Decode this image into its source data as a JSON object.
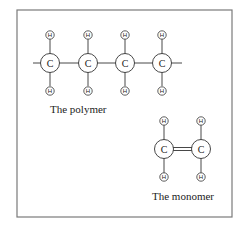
{
  "polymer": {
    "caption": "The polymer",
    "carbon_label": "C",
    "hydrogen_label": "H",
    "carbons": [
      {
        "x": 50,
        "y": 63
      },
      {
        "x": 88,
        "y": 63
      },
      {
        "x": 125,
        "y": 63
      },
      {
        "x": 162,
        "y": 63
      }
    ]
  },
  "monomer": {
    "caption": "The monomer",
    "carbon_label": "C",
    "hydrogen_label": "H",
    "bond": "double",
    "carbons": [
      {
        "x": 164,
        "y": 149
      },
      {
        "x": 201,
        "y": 149
      }
    ]
  },
  "colors": {
    "frame": "#7a7a7a",
    "ink": "#333333"
  }
}
